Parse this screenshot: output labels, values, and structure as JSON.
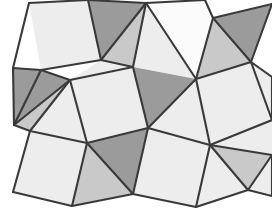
{
  "figure": {
    "width": 272,
    "height": 221,
    "background_color": "#ffffff",
    "stroke_color": "#3a3a3a",
    "stroke_width": 2.1
  },
  "palette": {
    "white": "#fbfbfb",
    "light": "#ededed",
    "medium": "#c9c9c9",
    "dark": "#9b9b9b",
    "outline": "#3a3a3a"
  },
  "chart_data": {
    "type": "diagram",
    "xlabel": "",
    "ylabel": "",
    "xlim": [
      0,
      272
    ],
    "ylim": [
      0,
      221
    ],
    "grid": false,
    "legend": "none",
    "shape_count": 34,
    "shapes": [
      {
        "name": "square-top-left",
        "kind": "square",
        "shade": "light",
        "points": "29,3 88,0 101,60 41,70"
      },
      {
        "name": "triangle-top-a",
        "kind": "triangle",
        "shade": "dark",
        "points": "88,0 146,3 101,60"
      },
      {
        "name": "triangle-top-b",
        "kind": "triangle",
        "shade": "medium",
        "points": "101,60 146,3 133,67"
      },
      {
        "name": "square-top-center",
        "kind": "square",
        "shade": "white",
        "points": "146,3 205,0 213,18 196,79"
      },
      {
        "name": "triangle-top-c",
        "kind": "triangle",
        "shade": "light",
        "points": "146,3 196,79 133,67"
      },
      {
        "name": "triangle-top-right-a",
        "kind": "triangle",
        "shade": "dark",
        "points": "213,18 272,4 251,62"
      },
      {
        "name": "triangle-top-right-b",
        "kind": "triangle",
        "shade": "medium",
        "points": "213,18 251,62 196,79"
      },
      {
        "name": "triangle-left-upper",
        "kind": "triangle",
        "shade": "dark",
        "points": "13,68 41,70 14,125"
      },
      {
        "name": "triangle-left-mid",
        "kind": "triangle",
        "shade": "dark",
        "points": "41,70 70,80 14,125"
      },
      {
        "name": "triangle-left-lower",
        "kind": "triangle",
        "shade": "medium",
        "points": "14,125 70,80 30,131"
      },
      {
        "name": "triangle-left-fan",
        "kind": "triangle",
        "shade": "light",
        "points": "70,80 87,143 30,131"
      },
      {
        "name": "square-center",
        "kind": "square",
        "shade": "light",
        "points": "70,80 133,67 148,128 87,143"
      },
      {
        "name": "triangle-center-upper",
        "kind": "triangle",
        "shade": "light",
        "points": "101,60 133,67 70,80"
      },
      {
        "name": "triangle-mid-a",
        "kind": "triangle",
        "shade": "dark",
        "points": "133,67 196,79 148,128"
      },
      {
        "name": "triangle-mid-b",
        "kind": "triangle",
        "shade": "light",
        "points": "196,79 210,145 148,128"
      },
      {
        "name": "square-right-mid",
        "kind": "square",
        "shade": "light",
        "points": "196,79 251,62 272,120 210,145"
      },
      {
        "name": "triangle-right-upper",
        "kind": "triangle",
        "shade": "light",
        "points": "251,62 272,77 272,120"
      },
      {
        "name": "square-bottom-left",
        "kind": "square",
        "shade": "light",
        "points": "30,131 87,143 72,206 13,192"
      },
      {
        "name": "triangle-bottom-a",
        "kind": "triangle",
        "shade": "medium",
        "points": "87,143 133,194 72,206"
      },
      {
        "name": "triangle-bottom-b",
        "kind": "triangle",
        "shade": "dark",
        "points": "87,143 148,128 133,194"
      },
      {
        "name": "square-bottom-center",
        "kind": "square",
        "shade": "light",
        "points": "148,128 210,145 196,207 133,194"
      },
      {
        "name": "triangle-bottom-c",
        "kind": "triangle",
        "shade": "light",
        "points": "210,145 248,190 196,207"
      },
      {
        "name": "triangle-bottom-right-a",
        "kind": "triangle",
        "shade": "medium",
        "points": "210,145 272,155 248,190"
      },
      {
        "name": "triangle-bottom-right-b",
        "kind": "triangle",
        "shade": "light",
        "points": "210,145 272,120 272,155"
      },
      {
        "name": "triangle-bottom-right-c",
        "kind": "triangle",
        "shade": "light",
        "points": "248,190 272,155 272,196"
      }
    ],
    "edges": [
      "29,3 88,0",
      "88,0 146,3",
      "146,3 205,0",
      "205,0 213,18",
      "213,18 272,4",
      "29,3 13,68",
      "13,68 41,70",
      "41,70 101,60",
      "101,60 88,0",
      "101,60 146,3",
      "101,60 133,67",
      "133,67 146,3",
      "146,3 196,79",
      "196,79 213,18",
      "213,18 251,62",
      "251,62 196,79",
      "251,62 272,4",
      "251,62 272,77",
      "272,77 272,120",
      "251,62 272,120",
      "13,68 14,125",
      "41,70 14,125",
      "41,70 70,80",
      "70,80 14,125",
      "14,125 30,131",
      "30,131 70,80",
      "70,80 133,67",
      "70,80 87,143",
      "87,143 30,131",
      "87,143 148,128",
      "148,128 133,67",
      "148,128 196,79",
      "196,79 210,145",
      "210,145 148,128",
      "210,145 272,120",
      "30,131 13,192",
      "13,192 72,206",
      "72,206 87,143",
      "72,206 133,194",
      "133,194 87,143",
      "133,194 148,128",
      "133,194 196,207",
      "196,207 210,145",
      "196,207 248,190",
      "248,190 210,145",
      "248,190 272,155",
      "272,155 210,145",
      "272,155 272,196",
      "248,190 272,196"
    ]
  }
}
